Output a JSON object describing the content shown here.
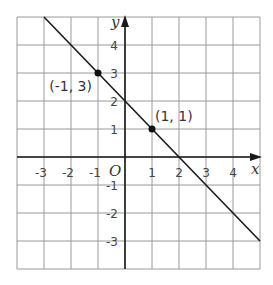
{
  "chart_data": {
    "type": "line",
    "title": "",
    "xlabel": "x",
    "ylabel": "y",
    "origin_label": "O",
    "xlim": [
      -4,
      5
    ],
    "ylim": [
      -4,
      5
    ],
    "grid": true,
    "x_ticks": [
      -3,
      -2,
      -1,
      1,
      2,
      3,
      4
    ],
    "y_ticks": [
      4,
      3,
      2,
      1,
      -1,
      -2,
      -3
    ],
    "x_tick_labels": [
      "-3",
      "-2",
      "-1",
      "1",
      "2",
      "3",
      "4"
    ],
    "y_tick_labels": [
      "4",
      "3",
      "2",
      "1",
      "-1",
      "-2",
      "-3"
    ],
    "series": [
      {
        "name": "line",
        "equation": "y = -x + 2",
        "x": [
          -3,
          5
        ],
        "y": [
          5,
          -3
        ]
      }
    ],
    "points": [
      {
        "x": -1,
        "y": 3,
        "label": "(-1, 3)"
      },
      {
        "x": 1,
        "y": 1,
        "label": "(1, 1)"
      }
    ],
    "colors": {
      "grid": "#9a9a9a",
      "axis": "#1a1a1a",
      "line": "#1a1a1a",
      "point": "#111111"
    }
  }
}
